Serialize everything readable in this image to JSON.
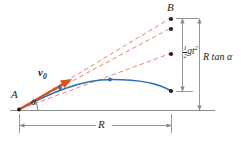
{
  "figure": {
    "type": "projectile-motion-diagram",
    "colors": {
      "trajectory": "#2f6fae",
      "velocity_arrow": "#d9531e",
      "dashed_lines": "#e8866b",
      "axis": "#8a8a8a",
      "ink": "#231f20"
    },
    "labels": {
      "point_B": "B",
      "point_A": "A",
      "angle": "α",
      "velocity": "v",
      "velocity_sub": "0",
      "range": "R",
      "drop_num": "1",
      "drop_den": "2",
      "drop_expr": "gt",
      "drop_exp": "2",
      "vertical_offset": "R tan α"
    },
    "geometry": {
      "origin_A": [
        18,
        110
      ],
      "target_B": [
        171,
        19
      ],
      "ground_y": 110,
      "range_px": 153,
      "launch_angle_deg": 31,
      "trajectory_points": [
        [
          18,
          110
        ],
        [
          60,
          88
        ],
        [
          107,
          80
        ],
        [
          171,
          91
        ]
      ],
      "dot_positions": [
        [
          60,
          88
        ],
        [
          107,
          80
        ],
        [
          171,
          91
        ],
        [
          171,
          19
        ],
        [
          171,
          29
        ],
        [
          171,
          54
        ]
      ]
    }
  }
}
